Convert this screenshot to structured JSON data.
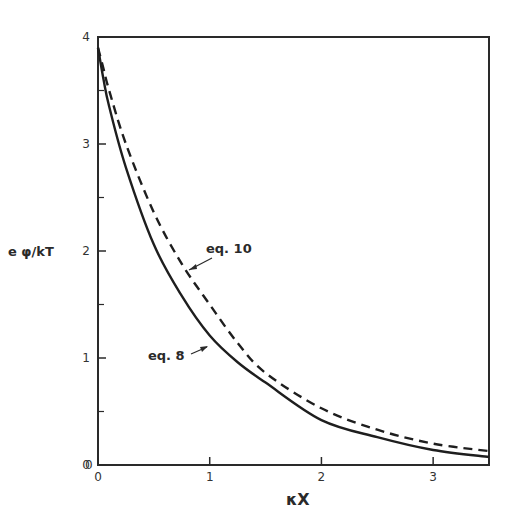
{
  "chart_data": {
    "type": "line",
    "title": "",
    "xlabel": "κX",
    "ylabel": "e φ/kT",
    "xlim": [
      0,
      3.5
    ],
    "ylim": [
      0,
      4
    ],
    "xticks": [
      0,
      1,
      2,
      3
    ],
    "xtick_labels": [
      "0",
      "1",
      "2",
      "3"
    ],
    "yticks": [
      0,
      1,
      2,
      3,
      4
    ],
    "ytick_labels": [
      "0",
      "1",
      "2",
      "3",
      "4"
    ],
    "y_minor_ticks": [
      0.5,
      1.5,
      2.5,
      3.5
    ],
    "grid": false,
    "legend": "none (inline annotations)",
    "series": [
      {
        "name": "eq. 8",
        "style": "solid",
        "x": [
          0,
          0.05,
          0.1,
          0.25,
          0.5,
          0.75,
          1.0,
          1.25,
          1.5,
          2.0,
          2.5,
          3.0,
          3.5
        ],
        "y": [
          3.9,
          3.6,
          3.35,
          2.78,
          2.06,
          1.58,
          1.21,
          0.96,
          0.77,
          0.42,
          0.26,
          0.14,
          0.075
        ]
      },
      {
        "name": "eq. 10",
        "style": "dashed",
        "x": [
          0,
          0.05,
          0.1,
          0.25,
          0.5,
          0.75,
          1.0,
          1.25,
          1.5,
          2.0,
          2.5,
          3.0,
          3.5
        ],
        "y": [
          3.9,
          3.7,
          3.5,
          3.0,
          2.36,
          1.88,
          1.5,
          1.14,
          0.86,
          0.53,
          0.33,
          0.2,
          0.13
        ]
      }
    ],
    "annotations": [
      {
        "text": "eq. 10",
        "points_to_series": "eq. 10",
        "at_x": 0.8
      },
      {
        "text": "eq. 8",
        "points_to_series": "eq. 8",
        "at_x": 0.95
      }
    ]
  },
  "labels": {
    "y_axis": "e φ/kT",
    "x_axis": "κX",
    "eq10": "eq. 10",
    "eq8": "eq. 8",
    "x_origin_extra": "0"
  }
}
